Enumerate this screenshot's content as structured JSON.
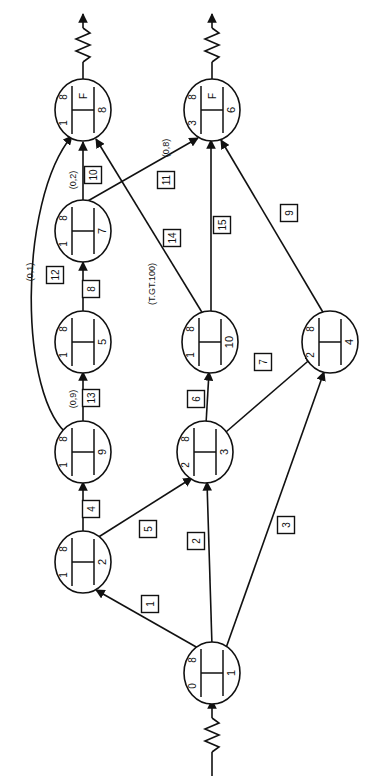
{
  "diagram": {
    "orientation": "rotated-90-ccw",
    "stroke_color": "#111111",
    "background_color": "#ffffff",
    "nodes": [
      {
        "id": "n1",
        "label": "1",
        "left": "0",
        "right": "8",
        "mid": "",
        "cx": 212,
        "cy": 673
      },
      {
        "id": "n2",
        "label": "2",
        "left": "1",
        "right": "8",
        "mid": "",
        "cx": 83,
        "cy": 562
      },
      {
        "id": "n3",
        "label": "3",
        "left": "2",
        "right": "8",
        "mid": "",
        "cx": 205,
        "cy": 452
      },
      {
        "id": "n4",
        "label": "4",
        "left": "2",
        "right": "8",
        "mid": "",
        "cx": 330,
        "cy": 342
      },
      {
        "id": "n5",
        "label": "5",
        "left": "1",
        "right": "8",
        "mid": "",
        "cx": 83,
        "cy": 342
      },
      {
        "id": "n6",
        "label": "6",
        "left": "3",
        "right": "8",
        "mid": "F",
        "cx": 212,
        "cy": 110
      },
      {
        "id": "n7",
        "label": "7",
        "left": "1",
        "right": "8",
        "mid": "",
        "cx": 83,
        "cy": 231
      },
      {
        "id": "n8",
        "label": "8",
        "left": "1",
        "right": "8",
        "mid": "F",
        "cx": 83,
        "cy": 110
      },
      {
        "id": "n9",
        "label": "9",
        "left": "1",
        "right": "8",
        "mid": "",
        "cx": 83,
        "cy": 452
      },
      {
        "id": "n10",
        "label": "10",
        "left": "1",
        "right": "8",
        "mid": "",
        "cx": 210,
        "cy": 342
      }
    ],
    "edge_labels": [
      {
        "id": "e1",
        "text": "1",
        "x": 150,
        "y": 604
      },
      {
        "id": "e2",
        "text": "2",
        "x": 196,
        "y": 541
      },
      {
        "id": "e3",
        "text": "3",
        "x": 286,
        "y": 525
      },
      {
        "id": "e4",
        "text": "4",
        "x": 91,
        "y": 509
      },
      {
        "id": "e5",
        "text": "5",
        "x": 148,
        "y": 529
      },
      {
        "id": "e6",
        "text": "6",
        "x": 196,
        "y": 399
      },
      {
        "id": "e7",
        "text": "7",
        "x": 263,
        "y": 362
      },
      {
        "id": "e8",
        "text": "8",
        "x": 91,
        "y": 289
      },
      {
        "id": "e9",
        "text": "9",
        "x": 289,
        "y": 213
      },
      {
        "id": "e10",
        "text": "10",
        "x": 93,
        "y": 175
      },
      {
        "id": "e11",
        "text": "11",
        "x": 166,
        "y": 180
      },
      {
        "id": "e12",
        "text": "12",
        "x": 55,
        "y": 275
      },
      {
        "id": "e13",
        "text": "13",
        "x": 91,
        "y": 398
      },
      {
        "id": "e14",
        "text": "14",
        "x": 172,
        "y": 238
      },
      {
        "id": "e15",
        "text": "15",
        "x": 222,
        "y": 225
      }
    ],
    "condition_labels": [
      {
        "id": "c1",
        "text": "(0,1)",
        "x": 30,
        "y": 272
      },
      {
        "id": "c2",
        "text": "(0,2)",
        "x": 73,
        "y": 180
      },
      {
        "id": "c3",
        "text": "(0,9)",
        "x": 73,
        "y": 399
      },
      {
        "id": "c4",
        "text": "(0,8)",
        "x": 166,
        "y": 148
      },
      {
        "id": "c5",
        "text": "(T.GT.100)",
        "x": 152,
        "y": 284
      }
    ]
  }
}
